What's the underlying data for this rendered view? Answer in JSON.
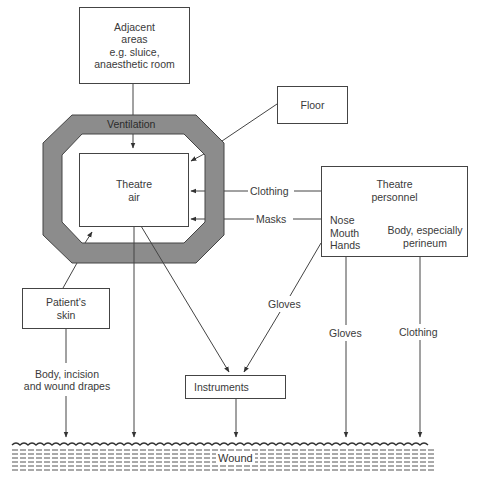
{
  "diagram": {
    "nodes": {
      "adjacent_areas": {
        "lines": [
          "Adjacent",
          "areas",
          "e.g. sluice,",
          "anaesthetic room"
        ]
      },
      "floor": {
        "label": "Floor"
      },
      "ventilation": {
        "label": "Ventilation"
      },
      "theatre_air": {
        "lines": [
          "Theatre",
          "air"
        ]
      },
      "theatre_personnel": {
        "title_lines": [
          "Theatre",
          "personnel"
        ],
        "sub_left_lines": [
          "Nose",
          "Mouth",
          "Hands"
        ],
        "sub_right_lines": [
          "Body, especially",
          "perineum"
        ]
      },
      "patients_skin": {
        "lines": [
          "Patient's",
          "skin"
        ]
      },
      "instruments": {
        "label": "Instruments"
      },
      "wound": {
        "label": "Wound"
      }
    },
    "edge_labels": {
      "clothing_to_air": "Clothing",
      "masks_to_air": "Masks",
      "gloves_to_instruments": "Gloves",
      "gloves_to_wound": "Gloves",
      "clothing_to_wound": "Clothing",
      "skin_to_wound_lines": [
        "Body, incision",
        "and wound drapes"
      ]
    },
    "edges": [
      {
        "from": "adjacent_areas",
        "to": "theatre_air"
      },
      {
        "from": "floor",
        "to": "theatre_air"
      },
      {
        "from": "theatre_personnel",
        "to": "theatre_air",
        "label": "Clothing"
      },
      {
        "from": "theatre_personnel",
        "to": "theatre_air",
        "label": "Masks"
      },
      {
        "from": "patients_skin",
        "to": "theatre_air"
      },
      {
        "from": "theatre_air",
        "to": "wound"
      },
      {
        "from": "theatre_air",
        "to": "instruments"
      },
      {
        "from": "theatre_personnel",
        "to": "instruments",
        "label": "Gloves"
      },
      {
        "from": "theatre_personnel",
        "to": "wound",
        "label": "Gloves"
      },
      {
        "from": "theatre_personnel",
        "to": "wound",
        "label": "Clothing"
      },
      {
        "from": "patients_skin",
        "to": "wound",
        "label": "Body, incision and wound drapes"
      },
      {
        "from": "instruments",
        "to": "wound"
      }
    ],
    "colors": {
      "ventilation_fill": "#8c8c8c",
      "line": "#444444",
      "background": "#ffffff"
    }
  }
}
